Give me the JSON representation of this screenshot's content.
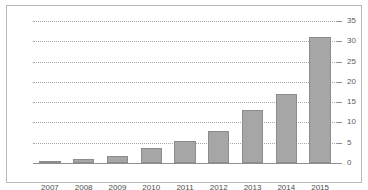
{
  "chart_data": {
    "type": "bar",
    "title": "",
    "subtitle": "",
    "xlabel": "",
    "ylabel": "",
    "categories": [
      "2007",
      "2008",
      "2009",
      "2010",
      "2011",
      "2012",
      "2013",
      "2014",
      "2015"
    ],
    "values": [
      0.4,
      1.0,
      1.7,
      3.7,
      5.5,
      8.0,
      13.0,
      17.0,
      31.0
    ],
    "series": [
      {
        "name": "",
        "values": [
          0.4,
          1.0,
          1.7,
          3.7,
          5.5,
          8.0,
          13.0,
          17.0,
          31.0
        ]
      }
    ],
    "ylim": [
      0,
      35
    ],
    "yticks": [
      0,
      5,
      10,
      15,
      20,
      25,
      30,
      35
    ],
    "ytick_labels": [
      "0",
      "5",
      "10",
      "15",
      "20",
      "25",
      "30",
      "35"
    ],
    "grid": true,
    "grid_style": "dotted",
    "grid_axis": "y",
    "y_axis_position": "right",
    "legend": false,
    "legend_position": "none",
    "annotations": [],
    "colors": {
      "bar_fill": "#a6a6a6",
      "bar_stroke": "#8c8c8c",
      "gridline": "#a8a8a8",
      "axis": "#8f8f8f",
      "frame": "#b9b9b9",
      "tick_label": "#5c5c5c",
      "category_label": "#4d4d4d",
      "background": "#ffffff"
    }
  }
}
